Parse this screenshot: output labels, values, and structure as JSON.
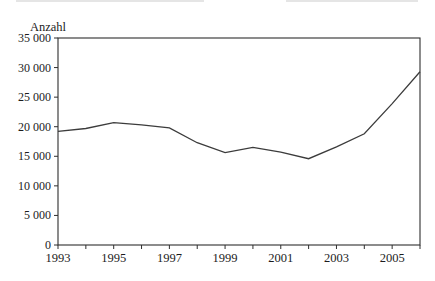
{
  "chart_data": {
    "type": "line",
    "title": "",
    "xlabel": "",
    "ylabel": "Anzahl",
    "x": [
      1993,
      1994,
      1995,
      1996,
      1997,
      1998,
      1999,
      2000,
      2001,
      2002,
      2003,
      2004,
      2005,
      2006
    ],
    "values": [
      19200,
      19700,
      20700,
      20300,
      19800,
      17300,
      15600,
      16500,
      15700,
      14600,
      16600,
      18800,
      23900,
      29300
    ],
    "xlim": [
      1993,
      2006
    ],
    "ylim": [
      0,
      35000
    ],
    "yticks": [
      0,
      5000,
      10000,
      15000,
      20000,
      25000,
      30000,
      35000
    ],
    "ytick_labels": [
      "0",
      "5 000",
      "10 000",
      "15 000",
      "20 000",
      "25 000",
      "30 000",
      "35 000"
    ],
    "xticks": [
      1993,
      1994,
      1995,
      1996,
      1997,
      1998,
      1999,
      2000,
      2001,
      2002,
      2003,
      2004,
      2005,
      2006
    ],
    "xtick_labeled_years": [
      1993,
      1995,
      1997,
      1999,
      2001,
      2003,
      2005
    ],
    "xtick_labels": [
      "1993",
      "1995",
      "1997",
      "1999",
      "2001",
      "2003",
      "2005"
    ],
    "grid": false,
    "legend": "none",
    "line_color": "#3c3c3c",
    "axis_color": "#2e2e2e"
  }
}
